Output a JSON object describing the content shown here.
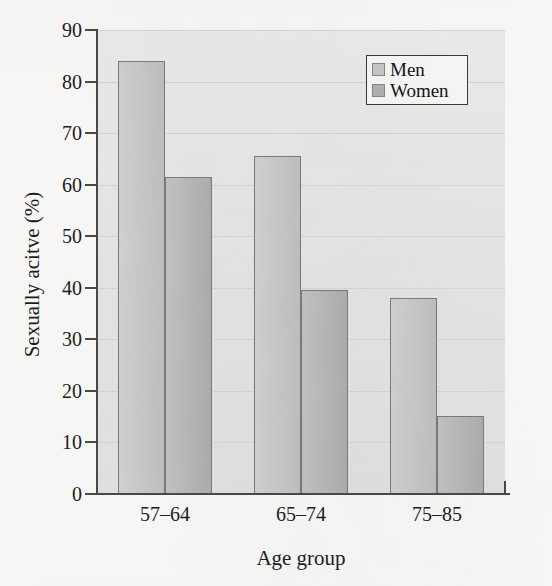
{
  "chart_data": {
    "type": "bar",
    "title": "",
    "subtitle": "",
    "xlabel": "Age group",
    "ylabel": "Sexually acitve (%)",
    "categories": [
      "57–64",
      "65–74",
      "75–85"
    ],
    "series": [
      {
        "name": "Men",
        "values": [
          84,
          65.5,
          38
        ],
        "color": "#c9c9c7"
      },
      {
        "name": "Women",
        "values": [
          61.4,
          39.5,
          15.2
        ],
        "color": "#b6b6b4"
      }
    ],
    "ylim": [
      0,
      90
    ],
    "ytick_values": [
      0,
      10,
      20,
      30,
      40,
      50,
      60,
      70,
      80,
      90
    ],
    "ytick_labels": [
      "0",
      "10",
      "20",
      "30",
      "40",
      "50",
      "60",
      "70",
      "80",
      "90"
    ],
    "grid": true,
    "legend_position": "top-right",
    "annotations": []
  },
  "legend": {
    "entries": [
      {
        "label": "Men",
        "swatch": "men-swatch"
      },
      {
        "label": "Women",
        "swatch": "women-swatch"
      }
    ]
  },
  "colors": {
    "plot_background": "#e9e9e7",
    "axis": "#4a4a4a",
    "gridline": "#d8d8d4",
    "bar_men": "#c9c9c7",
    "bar_women": "#b6b6b4",
    "bar_outline": "#7c7c7c",
    "text": "#1d1d1d",
    "legend_border": "#3a3a3a"
  }
}
